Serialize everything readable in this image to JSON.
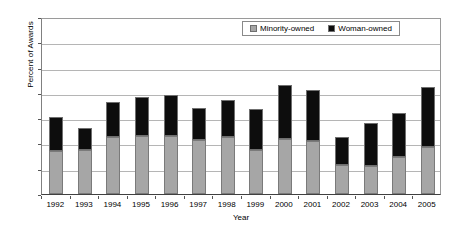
{
  "chart_data": {
    "type": "bar",
    "stacked": true,
    "title": "",
    "xlabel": "Year",
    "ylabel": "Percent of Awards",
    "ylim": [
      0,
      35
    ],
    "ytick_step": 5,
    "yticks": [
      "0",
      "5",
      "10",
      "15",
      "20",
      "25",
      "30",
      "35"
    ],
    "grid": "horizontal",
    "legend_position": "top-right inside plot",
    "categories": [
      "1992",
      "1993",
      "1994",
      "1995",
      "1996",
      "1997",
      "1998",
      "1999",
      "2000",
      "2001",
      "2002",
      "2003",
      "2004",
      "2005"
    ],
    "series": [
      {
        "name": "Minority-owned",
        "color": "#a6a6a6",
        "values": [
          8.5,
          8.8,
          11.3,
          11.4,
          11.5,
          10.6,
          11.2,
          8.8,
          10.9,
          10.5,
          5.7,
          5.6,
          7.4,
          9.3
        ]
      },
      {
        "name": "Woman-owned",
        "color": "#0d0d0d",
        "values": [
          6.7,
          4.2,
          6.9,
          7.7,
          8.1,
          6.5,
          7.3,
          8.0,
          10.7,
          10.0,
          5.6,
          8.4,
          8.6,
          11.9
        ]
      }
    ],
    "totals": [
      15.2,
      13.0,
      18.2,
      19.1,
      19.6,
      17.1,
      18.5,
      16.8,
      21.6,
      20.5,
      11.3,
      14.0,
      16.0,
      21.2
    ]
  },
  "legend": {
    "entries": [
      {
        "label": "Minority-owned"
      },
      {
        "label": "Woman-owned"
      }
    ]
  }
}
